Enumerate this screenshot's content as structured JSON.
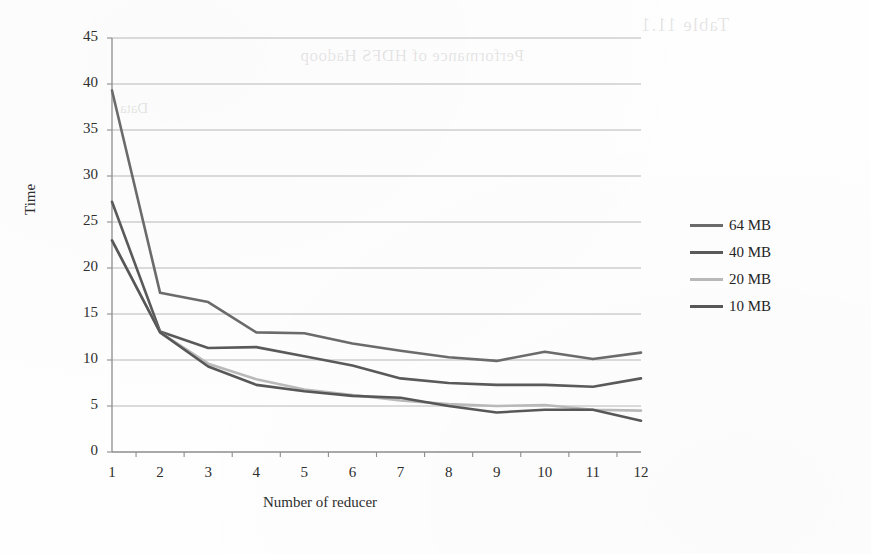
{
  "chart_data": {
    "type": "line",
    "title": "",
    "xlabel": "Number of reducer",
    "ylabel": "Time",
    "x": [
      1,
      2,
      3,
      4,
      5,
      6,
      7,
      8,
      9,
      10,
      11,
      12
    ],
    "xlim": [
      1,
      12
    ],
    "ylim": [
      0,
      45
    ],
    "ytick_step": 5,
    "yticks": [
      0,
      5,
      10,
      15,
      20,
      25,
      30,
      35,
      40,
      45
    ],
    "xticks": [
      "1",
      "2",
      "3",
      "4",
      "5",
      "6",
      "7",
      "8",
      "9",
      "10",
      "11",
      "12"
    ],
    "grid": "horizontal",
    "legend_position": "right",
    "series": [
      {
        "name": "64 MB",
        "color": "#6b6b6b",
        "values": [
          39.3,
          17.3,
          16.3,
          13.0,
          12.9,
          11.8,
          11.0,
          10.3,
          9.9,
          10.9,
          10.1,
          10.8
        ]
      },
      {
        "name": "40 MB",
        "color": "#5a5a5a",
        "values": [
          27.2,
          13.1,
          11.3,
          11.4,
          10.4,
          9.4,
          8.0,
          7.5,
          7.3,
          7.3,
          7.1,
          8.0
        ]
      },
      {
        "name": "20 MB",
        "color": "#b9b9b9",
        "values": [
          23.0,
          13.0,
          9.6,
          7.9,
          6.8,
          6.2,
          5.6,
          5.2,
          5.0,
          5.1,
          4.6,
          4.5
        ]
      },
      {
        "name": "10 MB",
        "color": "#575757",
        "values": [
          23.0,
          13.0,
          9.3,
          7.3,
          6.6,
          6.1,
          5.9,
          5.0,
          4.3,
          4.6,
          4.6,
          3.4
        ]
      }
    ]
  },
  "legend": {
    "items": [
      {
        "label": "64 MB",
        "color": "#6b6b6b"
      },
      {
        "label": "40 MB",
        "color": "#5a5a5a"
      },
      {
        "label": "20 MB",
        "color": "#b9b9b9"
      },
      {
        "label": "10 MB",
        "color": "#575757"
      }
    ]
  },
  "axes": {
    "y_title": "Time",
    "x_title": "Number of reducer"
  },
  "artifacts": {
    "ghost_a": "Table 11.1",
    "ghost_b": "Performance of HDFS Hadoop",
    "ghost_c": "Data"
  }
}
